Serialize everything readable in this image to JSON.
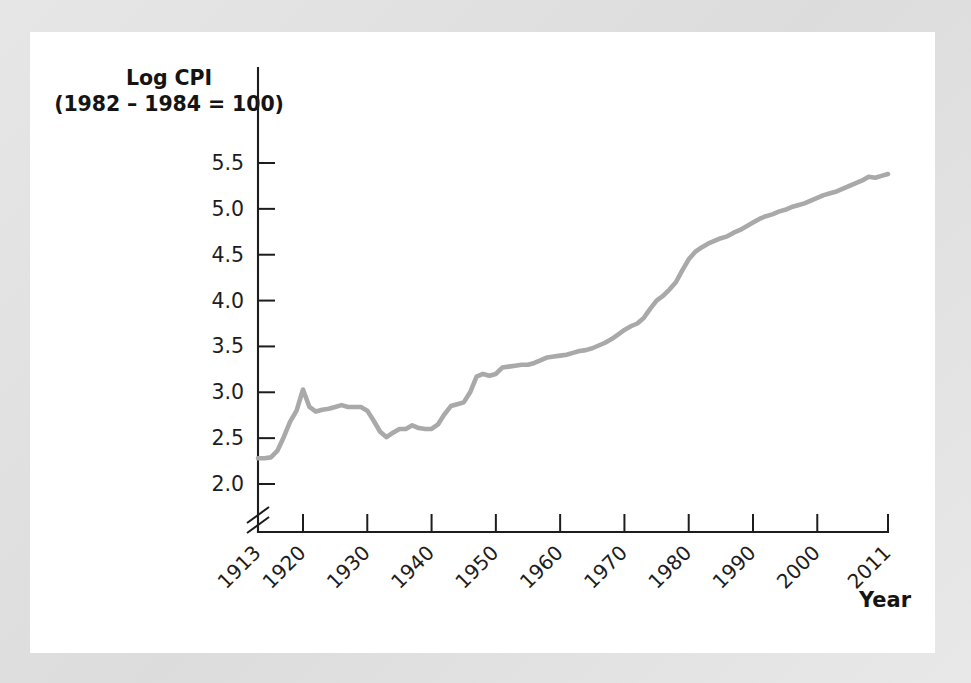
{
  "chart_data": {
    "type": "line",
    "title": "",
    "ylabel_line1": "Log CPI",
    "ylabel_line2": "(1982 – 1984 = 100)",
    "xlabel": "Year",
    "series_name": "Log CPI",
    "line_color": "#a9a9a9",
    "axis_color": "#1d1d1d",
    "panel_color": "#ffffff",
    "frame_color": "#e2e2e2",
    "grid": false,
    "legend": false,
    "axis_break": true,
    "axis_break_note": "y-axis broken below 2.0",
    "ylim": [
      1.78,
      5.78
    ],
    "xlim": [
      1913,
      2011
    ],
    "yticks": [
      "2.0",
      "2.5",
      "3.0",
      "3.5",
      "4.0",
      "4.5",
      "5.0",
      "5.5"
    ],
    "ytick_values": [
      2.0,
      2.5,
      3.0,
      3.5,
      4.0,
      4.5,
      5.0,
      5.5
    ],
    "xticks": [
      "1913",
      "1920",
      "1930",
      "1940",
      "1950",
      "1960",
      "1970",
      "1980",
      "1990",
      "2000",
      "2011"
    ],
    "xtick_values": [
      1913,
      1920,
      1930,
      1940,
      1950,
      1960,
      1970,
      1980,
      1990,
      2000,
      2011
    ],
    "x": [
      1913,
      1914,
      1915,
      1916,
      1917,
      1918,
      1919,
      1920,
      1921,
      1922,
      1923,
      1924,
      1925,
      1926,
      1927,
      1928,
      1929,
      1930,
      1931,
      1932,
      1933,
      1934,
      1935,
      1936,
      1937,
      1938,
      1939,
      1940,
      1941,
      1942,
      1943,
      1944,
      1945,
      1946,
      1947,
      1948,
      1949,
      1950,
      1951,
      1952,
      1953,
      1954,
      1955,
      1956,
      1957,
      1958,
      1959,
      1960,
      1961,
      1962,
      1963,
      1964,
      1965,
      1966,
      1967,
      1968,
      1969,
      1970,
      1971,
      1972,
      1973,
      1974,
      1975,
      1976,
      1977,
      1978,
      1979,
      1980,
      1981,
      1982,
      1983,
      1984,
      1985,
      1986,
      1987,
      1988,
      1989,
      1990,
      1991,
      1992,
      1993,
      1994,
      1995,
      1996,
      1997,
      1998,
      1999,
      2000,
      2001,
      2002,
      2003,
      2004,
      2005,
      2006,
      2007,
      2008,
      2009,
      2010,
      2011
    ],
    "y": [
      2.28,
      2.28,
      2.29,
      2.36,
      2.51,
      2.68,
      2.8,
      3.03,
      2.84,
      2.79,
      2.81,
      2.82,
      2.84,
      2.86,
      2.84,
      2.84,
      2.84,
      2.8,
      2.69,
      2.57,
      2.51,
      2.56,
      2.6,
      2.6,
      2.64,
      2.61,
      2.6,
      2.6,
      2.65,
      2.76,
      2.85,
      2.87,
      2.89,
      3.0,
      3.17,
      3.2,
      3.18,
      3.2,
      3.27,
      3.28,
      3.29,
      3.3,
      3.3,
      3.32,
      3.35,
      3.38,
      3.39,
      3.4,
      3.41,
      3.43,
      3.45,
      3.46,
      3.48,
      3.51,
      3.54,
      3.58,
      3.63,
      3.68,
      3.72,
      3.75,
      3.81,
      3.91,
      4.0,
      4.05,
      4.12,
      4.2,
      4.33,
      4.45,
      4.53,
      4.58,
      4.62,
      4.65,
      4.68,
      4.7,
      4.74,
      4.77,
      4.81,
      4.85,
      4.89,
      4.92,
      4.94,
      4.97,
      4.99,
      5.02,
      5.04,
      5.06,
      5.09,
      5.12,
      5.15,
      5.17,
      5.19,
      5.22,
      5.25,
      5.28,
      5.31,
      5.35,
      5.34,
      5.36,
      5.38
    ]
  }
}
